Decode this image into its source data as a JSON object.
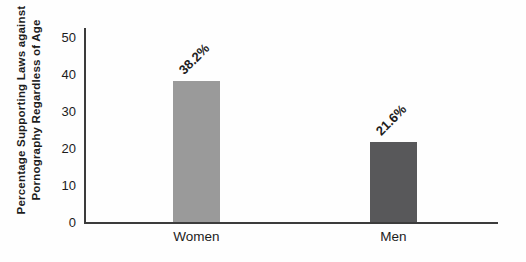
{
  "chart": {
    "y_axis_title_line1": "Percentage Supporting Laws against",
    "y_axis_title_line2": "Pornography Regardless of Age"
  },
  "chart_data": {
    "type": "bar",
    "categories": [
      "Women",
      "Men"
    ],
    "values": [
      38.2,
      21.6
    ],
    "value_labels": [
      "38.2%",
      "21.6%"
    ],
    "bar_colors": [
      "#9a9a9a",
      "#58585a"
    ],
    "title": "",
    "xlabel": "",
    "ylabel": "Percentage Supporting Laws against Pornography Regardless of Age",
    "ylim": [
      0,
      50
    ],
    "yticks": [
      0,
      10,
      20,
      30,
      40,
      50
    ],
    "grid": false,
    "legend": false,
    "value_label_rotation_deg": 45,
    "axis_color": "#3c3c3c",
    "text_color": "#1c1c1c"
  }
}
